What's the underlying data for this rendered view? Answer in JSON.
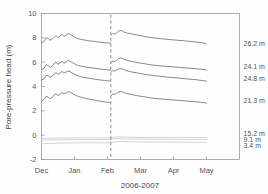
{
  "chart_data": {
    "type": "line",
    "title": "",
    "xlabel": "2006-2007",
    "ylabel": "Pore-pressure head (m)",
    "xlim": [
      0,
      6
    ],
    "ylim": [
      -2,
      10
    ],
    "grid": false,
    "legend_position": "right-of-axes (inline end labels)",
    "xtick_labels": [
      "Dec",
      "Jan",
      "Feb",
      "Mar",
      "Apr",
      "May"
    ],
    "xtick_values": [
      0,
      1,
      2,
      3,
      4,
      5
    ],
    "ytick_labels": [
      "10",
      "8",
      "6",
      "4",
      "2",
      "0",
      "-2"
    ],
    "ytick_values": [
      10,
      8,
      6,
      4,
      2,
      0,
      -2
    ],
    "annotations": [
      {
        "name": "event-line",
        "type": "vertical-dashed-line",
        "x": 2.1
      }
    ],
    "series": [
      {
        "name": "26.2 m",
        "label": "26.2 m",
        "color": "#606060",
        "x": [
          0.0,
          0.08,
          0.14,
          0.2,
          0.26,
          0.32,
          0.38,
          0.44,
          0.5,
          0.56,
          0.62,
          0.68,
          0.74,
          0.8,
          0.88,
          0.96,
          1.04,
          1.12,
          1.22,
          1.34,
          1.48,
          1.62,
          1.76,
          1.9,
          2.02,
          2.09
        ],
        "y": [
          7.55,
          7.7,
          8.0,
          7.96,
          7.8,
          7.88,
          8.05,
          8.18,
          8.02,
          8.14,
          8.28,
          8.12,
          8.2,
          8.34,
          8.28,
          8.12,
          8.0,
          7.92,
          7.86,
          7.8,
          7.74,
          7.7,
          7.64,
          7.6,
          7.58,
          7.56
        ]
      },
      {
        "name": "26.2 m (post)",
        "label": "",
        "color": "#606060",
        "x": [
          2.11,
          2.16,
          2.22,
          2.28,
          2.34,
          2.42,
          2.5,
          2.58,
          2.66,
          2.76,
          2.88,
          3.0,
          3.14,
          3.28,
          3.44,
          3.6,
          3.78,
          3.96,
          4.14,
          4.32,
          4.5,
          4.68,
          4.84,
          4.96,
          5.0
        ],
        "y": [
          8.22,
          8.36,
          8.3,
          8.42,
          8.56,
          8.62,
          8.48,
          8.4,
          8.36,
          8.3,
          8.24,
          8.18,
          8.1,
          8.04,
          7.98,
          7.94,
          7.88,
          7.84,
          7.8,
          7.76,
          7.7,
          7.66,
          7.6,
          7.54,
          7.5
        ]
      },
      {
        "name": "24.1 m",
        "label": "24.1 m",
        "color": "#606060",
        "x": [
          0.0,
          0.08,
          0.14,
          0.2,
          0.26,
          0.32,
          0.38,
          0.44,
          0.5,
          0.56,
          0.62,
          0.68,
          0.74,
          0.8,
          0.88,
          0.96,
          1.04,
          1.12,
          1.22,
          1.34,
          1.48,
          1.62,
          1.76,
          1.9,
          2.02,
          2.09
        ],
        "y": [
          5.4,
          5.5,
          5.8,
          5.72,
          5.58,
          5.66,
          5.88,
          6.0,
          5.82,
          5.92,
          6.08,
          5.92,
          6.0,
          6.14,
          6.06,
          5.92,
          5.8,
          5.72,
          5.66,
          5.6,
          5.54,
          5.5,
          5.44,
          5.4,
          5.36,
          5.34
        ]
      },
      {
        "name": "24.1 m (post)",
        "label": "",
        "color": "#606060",
        "x": [
          2.11,
          2.16,
          2.22,
          2.28,
          2.34,
          2.42,
          2.5,
          2.58,
          2.66,
          2.76,
          2.88,
          3.0,
          3.14,
          3.28,
          3.44,
          3.6,
          3.78,
          3.96,
          4.14,
          4.32,
          4.5,
          4.68,
          4.84,
          4.96,
          5.0
        ],
        "y": [
          5.96,
          6.1,
          6.04,
          6.16,
          6.3,
          6.36,
          6.24,
          6.16,
          6.1,
          6.04,
          5.98,
          5.92,
          5.86,
          5.8,
          5.74,
          5.7,
          5.66,
          5.62,
          5.58,
          5.54,
          5.5,
          5.46,
          5.42,
          5.38,
          5.34
        ]
      },
      {
        "name": "24.8 m",
        "label": "24.8 m",
        "color": "#606060",
        "x": [
          0.0,
          0.08,
          0.14,
          0.2,
          0.26,
          0.32,
          0.38,
          0.44,
          0.5,
          0.56,
          0.62,
          0.68,
          0.74,
          0.8,
          0.88,
          0.96,
          1.04,
          1.12,
          1.22,
          1.34,
          1.48,
          1.62,
          1.76,
          1.9,
          2.02,
          2.09
        ],
        "y": [
          4.52,
          4.64,
          4.92,
          4.88,
          4.76,
          4.84,
          5.02,
          5.14,
          5.0,
          5.1,
          5.24,
          5.1,
          5.18,
          5.28,
          5.2,
          5.06,
          4.94,
          4.86,
          4.78,
          4.72,
          4.66,
          4.6,
          4.54,
          4.5,
          4.46,
          4.44
        ]
      },
      {
        "name": "24.8 m (post)",
        "label": "",
        "color": "#606060",
        "x": [
          2.11,
          2.16,
          2.22,
          2.28,
          2.34,
          2.42,
          2.5,
          2.58,
          2.66,
          2.76,
          2.88,
          3.0,
          3.14,
          3.28,
          3.44,
          3.6,
          3.78,
          3.96,
          4.14,
          4.32,
          4.5,
          4.68,
          4.84,
          4.96,
          5.0
        ],
        "y": [
          5.18,
          5.32,
          5.26,
          5.36,
          5.44,
          5.48,
          5.38,
          5.3,
          5.24,
          5.18,
          5.12,
          5.06,
          5.0,
          4.94,
          4.88,
          4.84,
          4.78,
          4.74,
          4.7,
          4.64,
          4.6,
          4.56,
          4.5,
          4.46,
          4.42
        ]
      },
      {
        "name": "21.3 m",
        "label": "21.3 m",
        "color": "#606060",
        "x": [
          0.0,
          0.08,
          0.14,
          0.2,
          0.26,
          0.32,
          0.38,
          0.44,
          0.5,
          0.56,
          0.62,
          0.68,
          0.74,
          0.8,
          0.88,
          0.96,
          1.04,
          1.12,
          1.22,
          1.34,
          1.48,
          1.62,
          1.76,
          1.9,
          2.02,
          2.09
        ],
        "y": [
          2.82,
          2.94,
          3.2,
          3.12,
          3.0,
          3.08,
          3.28,
          3.4,
          3.26,
          3.36,
          3.52,
          3.38,
          3.46,
          3.58,
          3.52,
          3.38,
          3.26,
          3.18,
          3.1,
          3.02,
          2.94,
          2.88,
          2.8,
          2.74,
          2.7,
          2.68
        ]
      },
      {
        "name": "21.3 m (post)",
        "label": "",
        "color": "#606060",
        "x": [
          2.11,
          2.16,
          2.22,
          2.28,
          2.34,
          2.42,
          2.5,
          2.58,
          2.66,
          2.76,
          2.88,
          3.0,
          3.14,
          3.28,
          3.44,
          3.6,
          3.78,
          3.96,
          4.14,
          4.32,
          4.5,
          4.68,
          4.84,
          4.96,
          5.0
        ],
        "y": [
          3.24,
          3.4,
          3.34,
          3.46,
          3.56,
          3.6,
          3.5,
          3.42,
          3.38,
          3.32,
          3.26,
          3.2,
          3.14,
          3.08,
          3.02,
          2.98,
          2.94,
          2.9,
          2.86,
          2.82,
          2.78,
          2.74,
          2.7,
          2.66,
          2.62
        ]
      },
      {
        "name": "15.2 m",
        "label": "15.2 m",
        "color": "#c4c4c4",
        "x": [
          0.0,
          0.4,
          0.8,
          1.2,
          1.6,
          2.0,
          2.1,
          2.3,
          2.6,
          3.0,
          3.5,
          4.0,
          4.5,
          5.0
        ],
        "y": [
          -0.26,
          -0.24,
          -0.23,
          -0.22,
          -0.22,
          -0.22,
          -0.2,
          -0.14,
          -0.16,
          -0.18,
          -0.18,
          -0.18,
          -0.19,
          -0.2
        ]
      },
      {
        "name": "9.1 m",
        "label": "9.1 m",
        "color": "#c4c4c4",
        "x": [
          0.0,
          0.4,
          0.8,
          1.2,
          1.6,
          2.0,
          2.1,
          2.3,
          2.6,
          3.0,
          3.5,
          4.0,
          4.5,
          5.0
        ],
        "y": [
          -0.4,
          -0.38,
          -0.37,
          -0.36,
          -0.36,
          -0.36,
          -0.34,
          -0.28,
          -0.3,
          -0.32,
          -0.33,
          -0.34,
          -0.35,
          -0.36
        ]
      },
      {
        "name": "3.4 m",
        "label": "3.4 m",
        "color": "#c4c4c4",
        "x": [
          0.0,
          0.3,
          0.6,
          0.9,
          1.2,
          1.5,
          1.8,
          2.0,
          2.1,
          2.2,
          2.4,
          2.7,
          3.0,
          3.4,
          3.8,
          4.2,
          4.6,
          5.0
        ],
        "y": [
          -0.7,
          -0.68,
          -0.66,
          -0.64,
          -0.62,
          -0.62,
          -0.62,
          -0.62,
          -0.62,
          -0.56,
          -0.52,
          -0.54,
          -0.56,
          -0.57,
          -0.58,
          -0.58,
          -0.59,
          -0.6
        ]
      }
    ],
    "end_labels": [
      {
        "text": "26.2 m",
        "y": 7.5
      },
      {
        "text": "24.1 m",
        "y": 5.62
      },
      {
        "text": "24.8 m",
        "y": 4.62
      },
      {
        "text": "21.3 m",
        "y": 2.88
      },
      {
        "text": "15.2 m",
        "y": 0.1
      },
      {
        "text": "9.1 m",
        "y": -0.38
      },
      {
        "text": "3.4 m",
        "y": -0.84
      }
    ]
  }
}
